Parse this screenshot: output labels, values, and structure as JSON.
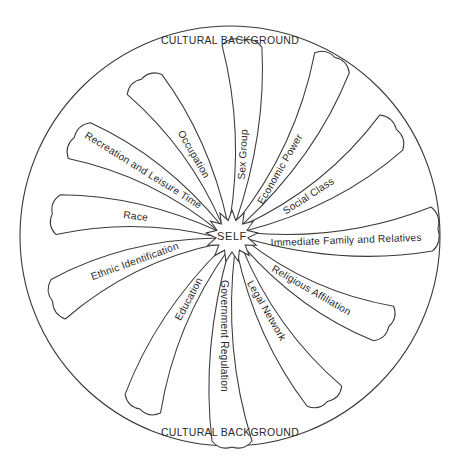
{
  "diagram": {
    "outer_circle": {
      "cx": 230,
      "cy": 236,
      "r": 210,
      "stroke": "#3a3a3a"
    },
    "outer_label_top": "CULTURAL BACKGROUND",
    "outer_label_bottom": "CULTURAL BACKGROUND",
    "center": {
      "label": "SELF",
      "x": 232,
      "y": 236
    },
    "petals": [
      {
        "label": "Sex Group",
        "angle": -87,
        "length": 190,
        "width": 40,
        "curve": 18,
        "label_offset": 52
      },
      {
        "label": "Economic Power",
        "angle": -60,
        "length": 200,
        "width": 40,
        "curve": 22,
        "label_offset": 52
      },
      {
        "label": "Social Class",
        "angle": -33,
        "length": 190,
        "width": 42,
        "curve": 22,
        "label_offset": 56
      },
      {
        "label": "Immediate Family and Relatives",
        "angle": -2,
        "length": 200,
        "width": 44,
        "curve": 22,
        "label_offset": 84
      },
      {
        "label": "Religious Affiliation",
        "angle": 30,
        "length": 175,
        "width": 40,
        "curve": 20,
        "label_offset": 66
      },
      {
        "label": "Legal Network",
        "angle": 60,
        "length": 185,
        "width": 40,
        "curve": 20,
        "label_offset": 52
      },
      {
        "label": "Government Regulation",
        "angle": 90,
        "length": 205,
        "width": 40,
        "curve": 20,
        "label_offset": 70
      },
      {
        "label": "Education",
        "angle": 118,
        "length": 190,
        "width": 40,
        "curve": 20,
        "label_offset": 46
      },
      {
        "label": "Ethnic Identification",
        "angle": 160,
        "length": 185,
        "width": 42,
        "curve": 22,
        "label_offset": 70
      },
      {
        "label": "Race",
        "angle": 187,
        "length": 175,
        "width": 40,
        "curve": 18,
        "label_offset": 68
      },
      {
        "label": "Recreation and Leisure Time",
        "angle": 212,
        "length": 180,
        "width": 42,
        "curve": 20,
        "label_offset": 80
      },
      {
        "label": "Occupation",
        "angle": 240,
        "length": 175,
        "width": 40,
        "curve": 18,
        "label_offset": 60
      },
      {
        "label": "Economic ",
        "angle": -999,
        "length": 0,
        "width": 0,
        "curve": 0,
        "label_offset": 0,
        "hidden": true
      }
    ]
  }
}
